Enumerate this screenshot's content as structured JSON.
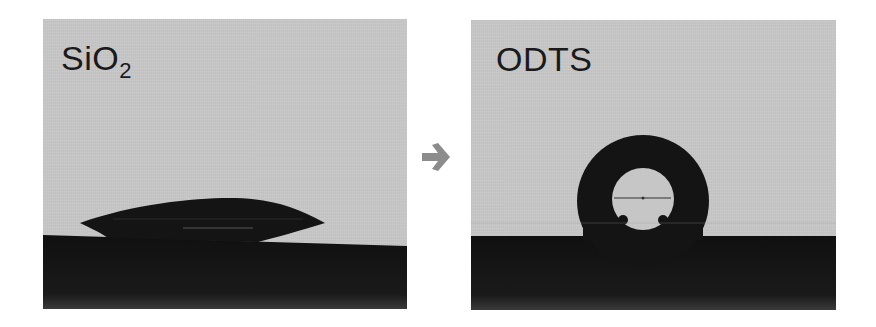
{
  "figure": {
    "panels": [
      {
        "label_main": "SiO",
        "label_sub": "2",
        "description": "water droplet spreading on SiO2 surface (low contact angle)"
      },
      {
        "label_main": "ODTS",
        "description": "water droplet beading on ODTS-treated surface (high contact angle)"
      }
    ],
    "arrow": "right-arrow-icon",
    "colors": {
      "background": "#c6c6c6",
      "droplet": "#141414",
      "substrate": "#121212",
      "arrow": "#8c8c8c",
      "text": "#1a1a1a"
    }
  }
}
